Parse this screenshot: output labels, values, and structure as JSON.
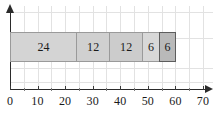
{
  "chart_data": {
    "type": "bar",
    "orientation": "horizontal",
    "stacked": true,
    "title": "",
    "subtitle": "",
    "xlabel": "",
    "ylabel": "",
    "xlim": [
      0,
      70
    ],
    "ylim": [
      0,
      1
    ],
    "xticks": [
      0,
      10,
      20,
      30,
      40,
      50,
      60,
      70
    ],
    "xtick_labels": [
      "0",
      "10",
      "20",
      "30",
      "40",
      "50",
      "60",
      "70"
    ],
    "minor_tick_step": 5,
    "grid": true,
    "grid_axis": "both",
    "grid_step": 5,
    "grid_color": "#e2e2e2",
    "legend": false,
    "total": 60,
    "categories": [
      "segment-1",
      "segment-2",
      "segment-3",
      "segment-4",
      "segment-5"
    ],
    "values": [
      24,
      12,
      12,
      6,
      6
    ],
    "labels": [
      "24",
      "12",
      "12",
      "6",
      "6"
    ],
    "cumulative_edges": [
      0,
      24,
      36,
      48,
      54,
      60
    ],
    "segments": [
      {
        "label": "24",
        "value": 24,
        "start": 0,
        "end": 24,
        "fill": "#d4d4d4",
        "border": "#9a9a9a",
        "highlight": false
      },
      {
        "label": "12",
        "value": 12,
        "start": 24,
        "end": 36,
        "fill": "#d0d0d0",
        "border": "#9a9a9a",
        "highlight": false
      },
      {
        "label": "12",
        "value": 12,
        "start": 36,
        "end": 48,
        "fill": "#cccccc",
        "border": "#9a9a9a",
        "highlight": false
      },
      {
        "label": "6",
        "value": 6,
        "start": 48,
        "end": 54,
        "fill": "#d8d8d8",
        "border": "#9a9a9a",
        "highlight": false
      },
      {
        "label": "6",
        "value": 6,
        "start": 54,
        "end": 60,
        "fill": "#b9b9b9",
        "border": "#5d5d5d",
        "highlight": true
      }
    ],
    "axis_color": "#2b2b2b"
  }
}
